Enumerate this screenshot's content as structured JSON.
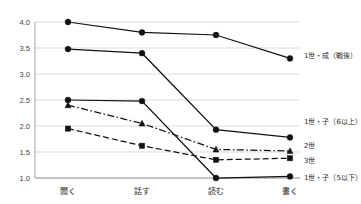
{
  "chart_data": {
    "type": "line",
    "title": "",
    "xlabel": "",
    "ylabel": "",
    "categories": [
      "聞く",
      "話す",
      "読む",
      "書く"
    ],
    "ylim": [
      1.0,
      4.0
    ],
    "ytick_labels": [
      "1.0",
      "1.5",
      "2.0",
      "2.5",
      "3.0",
      "3.5",
      "4.0"
    ],
    "ytick_values": [
      1.0,
      1.5,
      2.0,
      2.5,
      3.0,
      3.5,
      4.0
    ],
    "grid": true,
    "legend_position": "right-inline",
    "series": [
      {
        "name": "1世・成（戦後）",
        "values": [
          4.0,
          3.8,
          3.75,
          3.3
        ],
        "marker": "circle",
        "linestyle": "solid"
      },
      {
        "name": "1世・子（6以上）",
        "values": [
          3.48,
          3.4,
          1.93,
          1.78
        ],
        "marker": "circle",
        "linestyle": "solid"
      },
      {
        "name": "2世",
        "values": [
          2.4,
          2.05,
          1.55,
          1.52
        ],
        "marker": "triangle",
        "linestyle": "dashdot"
      },
      {
        "name": "3世",
        "values": [
          1.95,
          1.62,
          1.35,
          1.38
        ],
        "marker": "square",
        "linestyle": "dashed"
      },
      {
        "name": "1世・子（5以下）",
        "values": [
          2.5,
          2.48,
          1.0,
          1.03
        ],
        "marker": "circle",
        "linestyle": "solid"
      }
    ],
    "caption": ""
  }
}
